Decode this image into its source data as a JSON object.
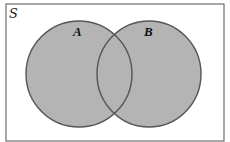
{
  "diagram": {
    "type": "venn",
    "universe": {
      "label": "S",
      "x": 6,
      "y": 4,
      "width": 218,
      "height": 137
    },
    "sets": [
      {
        "label": "A",
        "cx": 79,
        "cy": 74,
        "rx": 53,
        "ry": 53,
        "label_x": 77,
        "label_y": 36
      },
      {
        "label": "B",
        "cx": 149,
        "cy": 74,
        "rx": 52,
        "ry": 53,
        "label_x": 148,
        "label_y": 36
      }
    ],
    "shaded_region": "A ∪ B",
    "colors": {
      "fill": "#b4b4b4",
      "outline": "#555555",
      "border": "#6e6e6e",
      "background": "#ffffff"
    }
  }
}
